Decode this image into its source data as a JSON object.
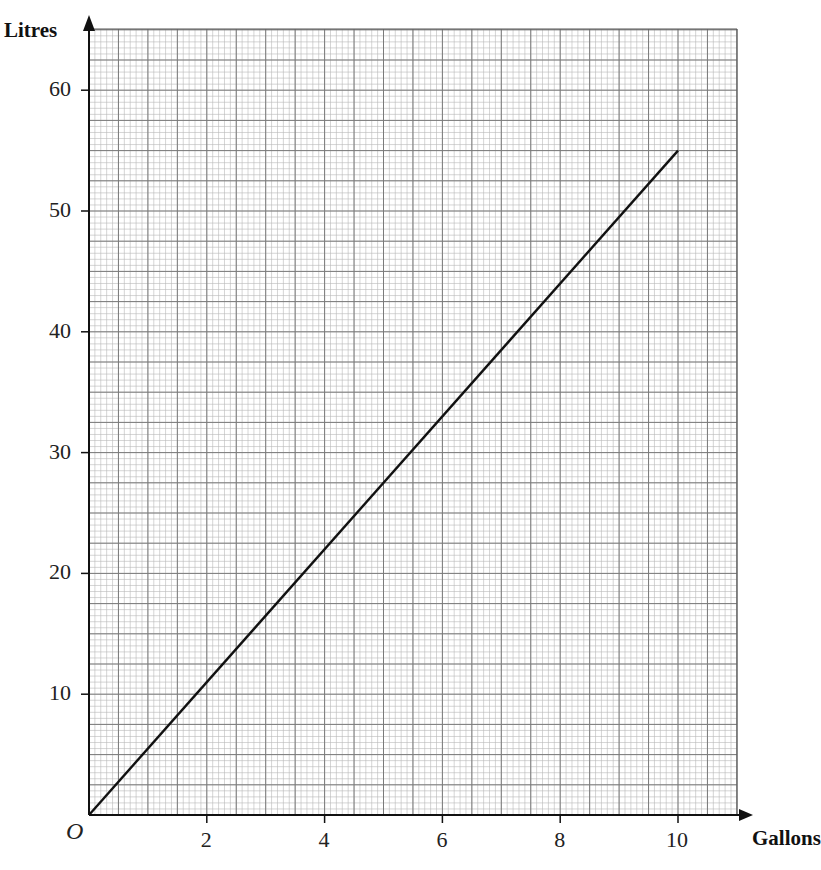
{
  "chart_data": {
    "type": "line",
    "title": "",
    "xlabel": "Gallons",
    "ylabel": "Litres",
    "origin_label": "O",
    "xlim": [
      0,
      11
    ],
    "ylim": [
      0,
      64
    ],
    "x_ticks": [
      2,
      4,
      6,
      8,
      10
    ],
    "x_tick_labels": [
      "2",
      "4",
      "6",
      "8",
      "10"
    ],
    "y_ticks": [
      10,
      20,
      30,
      40,
      50,
      60
    ],
    "y_tick_labels": [
      "10",
      "20",
      "30",
      "40",
      "50",
      "60"
    ],
    "grid": true,
    "grid_major_x": 0.5,
    "grid_minor_x": 0.1,
    "grid_major_y": 2.5,
    "grid_minor_y": 0.5,
    "legend": null,
    "series": [
      {
        "name": "Gallons to litres conversion",
        "x": [
          0,
          10
        ],
        "y": [
          0,
          55
        ],
        "color": "#111111"
      }
    ]
  },
  "layout": {
    "origin_px": [
      89,
      815
    ],
    "px_per_x": 58.9,
    "px_per_y": 12.08,
    "grid_right_px": 737,
    "grid_top_px": 29
  }
}
